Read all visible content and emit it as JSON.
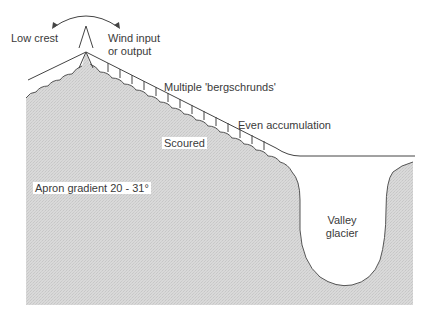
{
  "diagram": {
    "type": "cross-section",
    "labels": {
      "low_crest": "Low crest",
      "wind_line1": "Wind input",
      "wind_line2": "or output",
      "bergschrunds": "Multiple 'bergschrunds'",
      "even_accumulation": "Even accumulation",
      "scoured": "Scoured",
      "apron_gradient": "Apron gradient 20 - 31°",
      "valley_line1": "Valley",
      "valley_line2": "glacier"
    },
    "colors": {
      "rock_fill": "#d6d6d6",
      "line": "#444444",
      "text": "#3a3a3a",
      "background": "#ffffff"
    },
    "icons": [
      "double-headed-wind-arrow",
      "crest-peak-glyph"
    ]
  }
}
